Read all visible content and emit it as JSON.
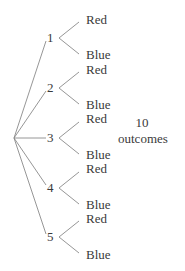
{
  "diagram": {
    "type": "tree",
    "root": {
      "x": 14,
      "y": 138
    },
    "line_color": "#8a8a8a",
    "text_color": "#3a3a3a",
    "nodes": [
      {
        "label": "1",
        "x": 50,
        "y": 38,
        "leaves": [
          {
            "label": "Red",
            "y": 20
          },
          {
            "label": "Blue",
            "y": 55
          }
        ]
      },
      {
        "label": "2",
        "x": 50,
        "y": 88,
        "leaves": [
          {
            "label": "Red",
            "y": 70
          },
          {
            "label": "Blue",
            "y": 105
          }
        ]
      },
      {
        "label": "3",
        "x": 50,
        "y": 138,
        "leaves": [
          {
            "label": "Red",
            "y": 119
          },
          {
            "label": "Blue",
            "y": 155
          }
        ]
      },
      {
        "label": "4",
        "x": 50,
        "y": 188,
        "leaves": [
          {
            "label": "Red",
            "y": 169
          },
          {
            "label": "Blue",
            "y": 205
          }
        ]
      },
      {
        "label": "5",
        "x": 50,
        "y": 237,
        "leaves": [
          {
            "label": "Red",
            "y": 219
          },
          {
            "label": "Blue",
            "y": 255
          }
        ]
      }
    ],
    "summary": {
      "count": "10",
      "label": "outcomes"
    }
  }
}
